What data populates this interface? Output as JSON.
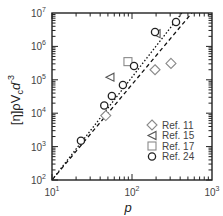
{
  "chart_data": {
    "type": "scatter",
    "title": "",
    "xlabel": "p",
    "ylabel": "[η]ρV_c d^-3",
    "xscale": "log",
    "yscale": "log",
    "xlim": [
      10,
      1000
    ],
    "ylim": [
      100,
      10000000
    ],
    "x_ticks": [
      {
        "base": "10",
        "exp": "1",
        "value": 10
      },
      {
        "base": "10",
        "exp": "2",
        "value": 100
      },
      {
        "base": "10",
        "exp": "3",
        "value": 1000
      }
    ],
    "y_ticks": [
      {
        "base": "10",
        "exp": "2",
        "value": 100
      },
      {
        "base": "10",
        "exp": "3",
        "value": 1000
      },
      {
        "base": "10",
        "exp": "4",
        "value": 10000
      },
      {
        "base": "10",
        "exp": "5",
        "value": 100000
      },
      {
        "base": "10",
        "exp": "6",
        "value": 1000000
      },
      {
        "base": "10",
        "exp": "7",
        "value": 10000000
      }
    ],
    "grid": false,
    "legend_position": "bottom-right",
    "series": [
      {
        "name": "Ref. 11",
        "marker": "diamond",
        "points": [
          [
            47,
            8500
          ],
          [
            194,
            200000
          ],
          [
            307,
            310000
          ]
        ]
      },
      {
        "name": "Ref. 15",
        "marker": "triangle-left",
        "points": [
          [
            53,
            120000
          ],
          [
            200,
            2400000
          ]
        ]
      },
      {
        "name": "Ref. 17",
        "marker": "square",
        "points": [
          [
            89,
            350000
          ]
        ]
      },
      {
        "name": "Ref. 24",
        "marker": "circle",
        "points": [
          [
            23,
            1500
          ],
          [
            45,
            17000
          ],
          [
            56,
            33000
          ],
          [
            77,
            70000
          ],
          [
            106,
            260000
          ],
          [
            194,
            2700000
          ],
          [
            355,
            5400000
          ]
        ]
      }
    ],
    "lines": [
      {
        "name": "dotted-fit",
        "style": "dotted",
        "points": [
          [
            10,
            100
          ],
          [
            420,
            10000000
          ]
        ]
      },
      {
        "name": "dashed-fit",
        "style": "dashed",
        "points": [
          [
            10,
            100
          ],
          [
            560,
            10000000
          ]
        ]
      }
    ]
  },
  "legend_labels": [
    "Ref. 11",
    "Ref. 15",
    "Ref. 17",
    "Ref. 24"
  ],
  "axis": {
    "xlabel": "p",
    "ylabel_main": "[η]ρV",
    "ylabel_sub": "c",
    "ylabel_tail": "d",
    "ylabel_exp": "-3"
  }
}
